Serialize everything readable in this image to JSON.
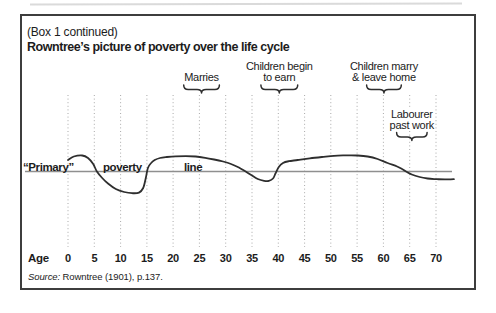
{
  "box": {
    "pretitle": "(Box 1 continued)",
    "title": "Rowntree’s picture of poverty over the life cycle",
    "source_prefix": "Source:",
    "source_rest": " Rowntree (1901), p.137."
  },
  "chart_data": {
    "type": "line",
    "title": "Rowntree’s picture of poverty over the life cycle",
    "xlabel": "Age",
    "x_ticks": [
      0,
      5,
      10,
      15,
      20,
      25,
      30,
      35,
      40,
      45,
      50,
      55,
      60,
      65,
      70
    ],
    "x_range": [
      0,
      73.4
    ],
    "grid": "vertical-dotted",
    "legend": "none",
    "y_units": "offset above the “primary” poverty line (schematic, px; 0 = poverty line)",
    "poverty_line": {
      "label_words": [
        "“Primary”",
        "poverty",
        "line"
      ],
      "value": 0
    },
    "annotations": [
      {
        "lines": [
          "Marries"
        ],
        "age_start": 22.0,
        "age_end": 28.8,
        "level": "upper"
      },
      {
        "lines": [
          "Children begin",
          "to earn"
        ],
        "age_start": 36.7,
        "age_end": 43.7,
        "level": "upper"
      },
      {
        "lines": [
          "Children marry",
          "& leave home"
        ],
        "age_start": 56.8,
        "age_end": 63.4,
        "level": "upper"
      },
      {
        "lines": [
          "Labourer",
          "past work"
        ],
        "age_start": 62.5,
        "age_end": 68.3,
        "level": "lower"
      }
    ],
    "series": [
      {
        "name": "family income relative to poverty line over the life cycle",
        "points": [
          [
            0,
            11.5
          ],
          [
            1.1,
            15
          ],
          [
            2.7,
            16
          ],
          [
            3.8,
            13.5
          ],
          [
            4.8,
            7.5
          ],
          [
            5.5,
            0
          ],
          [
            6.5,
            -6.5
          ],
          [
            7.6,
            -12
          ],
          [
            9.1,
            -17.5
          ],
          [
            10.7,
            -20.5
          ],
          [
            12.2,
            -21.7
          ],
          [
            13.5,
            -21.1
          ],
          [
            14.3,
            -16.5
          ],
          [
            14.8,
            -6.5
          ],
          [
            15.2,
            3.5
          ],
          [
            15.8,
            8.5
          ],
          [
            16.5,
            11.5
          ],
          [
            17.5,
            13.5
          ],
          [
            18.8,
            14.5
          ],
          [
            20.5,
            15.2
          ],
          [
            22.4,
            15.3
          ],
          [
            24.3,
            15
          ],
          [
            26.1,
            13.7
          ],
          [
            27.8,
            12
          ],
          [
            29.5,
            10
          ],
          [
            31,
            7.5
          ],
          [
            32.5,
            4
          ],
          [
            33.8,
            0
          ],
          [
            35,
            -4
          ],
          [
            36.1,
            -7.5
          ],
          [
            37.3,
            -9.3
          ],
          [
            38.2,
            -9.4
          ],
          [
            39,
            -7
          ],
          [
            39.5,
            -1.5
          ],
          [
            40.1,
            4.5
          ],
          [
            40.9,
            8.5
          ],
          [
            42,
            10.3
          ],
          [
            43.7,
            11.5
          ],
          [
            46,
            13.2
          ],
          [
            48.3,
            14.5
          ],
          [
            50.6,
            15.7
          ],
          [
            52.9,
            16.1
          ],
          [
            55.1,
            16
          ],
          [
            57,
            15
          ],
          [
            58.9,
            12.5
          ],
          [
            60.8,
            8.5
          ],
          [
            62.6,
            5
          ],
          [
            63.7,
            2
          ],
          [
            64.3,
            0
          ],
          [
            65.4,
            -3
          ],
          [
            66.9,
            -5.5
          ],
          [
            68.4,
            -7
          ],
          [
            70.2,
            -7.7
          ],
          [
            71.7,
            -7.9
          ],
          [
            73.4,
            -7.7
          ]
        ]
      }
    ],
    "colors": {
      "curve": "#2e2e2e",
      "poverty_line": "#8f8f8f",
      "gridline": "#a9a9a9",
      "text": "#1c1c1c",
      "border": "#3d3d3d"
    }
  }
}
